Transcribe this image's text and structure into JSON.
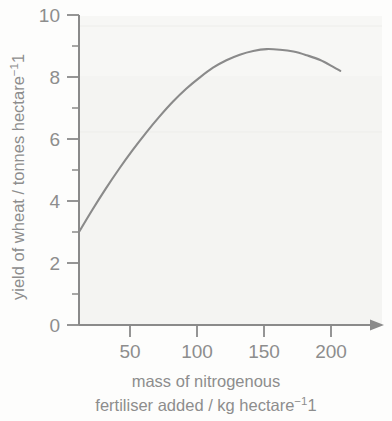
{
  "chart_data": {
    "type": "line",
    "title": "",
    "xlabel": "mass of nitrogenous fertiliser added / kg hectare⁻¹",
    "ylabel": "yield of wheat / tonnes hectare⁻¹",
    "xlim": [
      0,
      215
    ],
    "ylim": [
      0,
      10
    ],
    "grid": false,
    "legend": null,
    "x_ticks": [
      50,
      100,
      150,
      200
    ],
    "x_tick_labels": [
      "50",
      "100",
      "150",
      "200"
    ],
    "y_ticks": [
      0,
      1,
      2,
      3,
      4,
      5,
      6,
      7,
      8,
      9,
      10
    ],
    "y_tick_labels": [
      "0",
      "",
      "2",
      "",
      "4",
      "",
      "6",
      "",
      "8",
      "",
      "10"
    ],
    "y_major_ticks": [
      0,
      2,
      4,
      6,
      8,
      10
    ],
    "y_minor_ticks": [
      1,
      3,
      5,
      7,
      9
    ],
    "series": [
      {
        "name": "yield of wheat",
        "x": [
          0,
          10,
          20,
          30,
          40,
          50,
          60,
          70,
          80,
          90,
          100,
          110,
          120,
          130,
          140,
          150,
          160,
          170,
          180,
          190,
          195
        ],
        "y": [
          3.0,
          3.72,
          4.4,
          5.04,
          5.64,
          6.2,
          6.72,
          7.2,
          7.62,
          7.98,
          8.3,
          8.54,
          8.72,
          8.84,
          8.9,
          8.88,
          8.82,
          8.7,
          8.55,
          8.32,
          8.2
        ]
      }
    ],
    "annotations": [],
    "axis_arrow_x": true,
    "axis_arrow_y": false
  },
  "axes": {
    "y_label_line": "yield of wheat / tonnes hectare",
    "y_label_exponent": "−1",
    "x_caption_line1": "mass of nitrogenous",
    "x_caption_line2": "fertiliser added / kg hectare",
    "x_caption_exponent": "−1"
  },
  "colors": {
    "curve": "#8a8a8a",
    "axis": "#8a8a8a",
    "text": "#8d8d8d",
    "background": "#fdfdfc",
    "paper_tint": "#f4f4f2"
  }
}
